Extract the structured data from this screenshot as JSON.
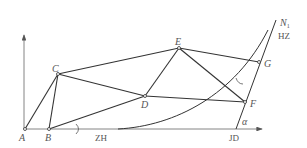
{
  "diagram": {
    "type": "survey-traverse-diagram",
    "colors": {
      "line": "#333333",
      "axis": "#555555",
      "label": "#555555",
      "background": "#ffffff"
    },
    "points": [
      {
        "id": "A",
        "label": "A",
        "x": 25,
        "y": 129
      },
      {
        "id": "B",
        "label": "B",
        "x": 49,
        "y": 129
      },
      {
        "id": "C",
        "label": "C",
        "x": 58,
        "y": 74
      },
      {
        "id": "D",
        "label": "D",
        "x": 145,
        "y": 96
      },
      {
        "id": "E",
        "label": "E",
        "x": 179,
        "y": 48
      },
      {
        "id": "F",
        "label": "F",
        "x": 245,
        "y": 102
      },
      {
        "id": "G",
        "label": "G",
        "x": 259,
        "y": 62
      }
    ],
    "edges": [
      [
        "A",
        "C"
      ],
      [
        "A",
        "B"
      ],
      [
        "B",
        "C"
      ],
      [
        "B",
        "D"
      ],
      [
        "C",
        "D"
      ],
      [
        "C",
        "E"
      ],
      [
        "D",
        "E"
      ],
      [
        "D",
        "F"
      ],
      [
        "E",
        "F"
      ],
      [
        "E",
        "G"
      ]
    ],
    "annotations": {
      "zh": "ZH",
      "jd": "JD",
      "hz": "HZ",
      "n1": "N",
      "n1_sub": "1",
      "alpha": "α"
    }
  }
}
